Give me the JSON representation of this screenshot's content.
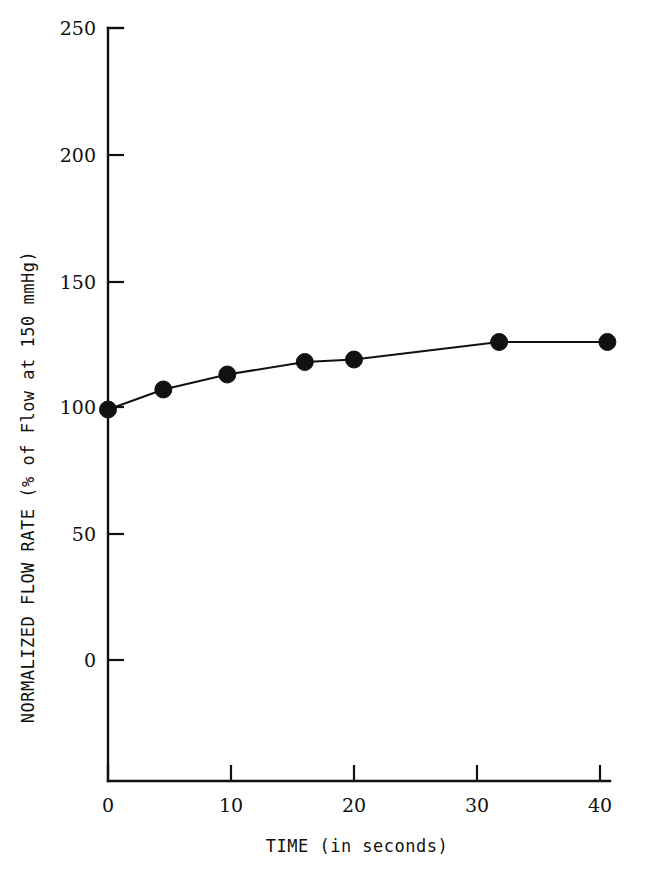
{
  "chart_data": {
    "type": "line",
    "title": "",
    "subtitle": "",
    "xlabel": "TIME (in seconds)",
    "ylabel": "NORMALIZED FLOW RATE (% of Flow at 150 mmHg)",
    "xlim": [
      0,
      40
    ],
    "ylim": [
      0,
      250
    ],
    "y_axis_extends_below_zero": true,
    "xticks": [
      0,
      10,
      20,
      30,
      40
    ],
    "xticklabels": [
      "0",
      "10",
      "20",
      "30",
      "40"
    ],
    "yticks": [
      0,
      50,
      100,
      150,
      200,
      250
    ],
    "yticklabels": [
      "0",
      "50",
      "100",
      "150",
      "200",
      "250"
    ],
    "grid": false,
    "legend": null,
    "marker": "filled-circle",
    "line_color": "#111111",
    "marker_color": "#111111",
    "background_color": "#ffffff",
    "x": [
      0,
      4.5,
      9.7,
      16.0,
      20.0,
      31.8,
      40.6
    ],
    "y": [
      99,
      107,
      113,
      118,
      119,
      126,
      126
    ],
    "series": [
      {
        "name": "Normalized flow rate",
        "points": [
          {
            "x": 0,
            "y": 99
          },
          {
            "x": 4.5,
            "y": 107
          },
          {
            "x": 9.7,
            "y": 113
          },
          {
            "x": 16.0,
            "y": 118
          },
          {
            "x": 20.0,
            "y": 119
          },
          {
            "x": 31.8,
            "y": 126
          },
          {
            "x": 40.6,
            "y": 126
          }
        ]
      }
    ]
  },
  "axes": {
    "y_tick_labels": [
      {
        "value": "250"
      },
      {
        "value": "200"
      },
      {
        "value": "150"
      },
      {
        "value": "100"
      },
      {
        "value": "50"
      },
      {
        "value": "0"
      }
    ],
    "x_tick_labels": [
      {
        "value": "0"
      },
      {
        "value": "10"
      },
      {
        "value": "20"
      },
      {
        "value": "30"
      },
      {
        "value": "40"
      }
    ],
    "x_axis_title": "TIME (in seconds)",
    "y_axis_title": "NORMALIZED FLOW RATE (% of Flow at 150 mmHg)"
  }
}
